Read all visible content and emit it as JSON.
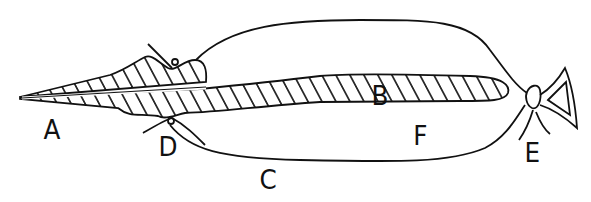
{
  "diagram": {
    "type": "line-drawing",
    "stroke_color": "#111111",
    "background": "#ffffff"
  },
  "labels": {
    "A": "A",
    "B": "B",
    "C": "C",
    "D": "D",
    "E": "E",
    "F": "F"
  }
}
